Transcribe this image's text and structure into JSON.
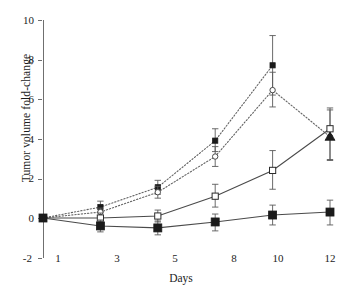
{
  "chart_data": {
    "type": "line",
    "title": "",
    "xlabel": "Days",
    "ylabel": "Tumor volume fold-change",
    "x": [
      1,
      3,
      5,
      8,
      10,
      12
    ],
    "xtick_labels": [
      "1",
      "3",
      "5",
      "8",
      "10",
      "12"
    ],
    "ytick_labels": [
      "-2",
      "0",
      "2",
      "4",
      "6",
      "8",
      "10"
    ],
    "yticks": [
      -2,
      0,
      2,
      4,
      6,
      8,
      10
    ],
    "ylim": [
      -2,
      10
    ],
    "grid": false,
    "legend": "none",
    "series": [
      {
        "name": "filled-square-dotted",
        "marker": "filled-square",
        "linestyle": "dotted",
        "values": [
          0,
          0.55,
          1.55,
          3.9,
          7.7,
          null
        ],
        "err_low": [
          0,
          0.25,
          0.35,
          0.55,
          1.5,
          null
        ],
        "err_high": [
          0,
          0.3,
          0.35,
          0.6,
          1.5,
          null
        ]
      },
      {
        "name": "open-circle-dotted",
        "marker": "open-circle",
        "linestyle": "dotted",
        "values": [
          0,
          0.3,
          1.3,
          3.1,
          6.45,
          4.1
        ],
        "err_low": [
          0,
          0.2,
          0.3,
          0.5,
          0.85,
          1.2
        ],
        "err_high": [
          0,
          0.2,
          0.3,
          0.5,
          0.9,
          1.35
        ]
      },
      {
        "name": "open-square-solid",
        "marker": "open-square",
        "linestyle": "solid",
        "values": [
          0,
          0.0,
          0.1,
          1.1,
          2.4,
          4.5
        ],
        "err_low": [
          0,
          0.25,
          0.3,
          0.55,
          0.95,
          1.55
        ],
        "err_high": [
          0,
          0.25,
          0.3,
          0.6,
          1.0,
          1.05
        ]
      },
      {
        "name": "filled-square-solid",
        "marker": "filled-square",
        "linestyle": "solid",
        "values": [
          0,
          -0.4,
          -0.5,
          -0.2,
          0.15,
          0.3
        ],
        "err_low": [
          0,
          0.3,
          0.35,
          0.45,
          0.5,
          0.65
        ],
        "err_high": [
          0,
          0.3,
          0.35,
          0.4,
          0.5,
          0.6
        ]
      }
    ],
    "endpoint_marker_day12": {
      "open_square": 4.5,
      "filled_triangle": 4.1
    }
  }
}
